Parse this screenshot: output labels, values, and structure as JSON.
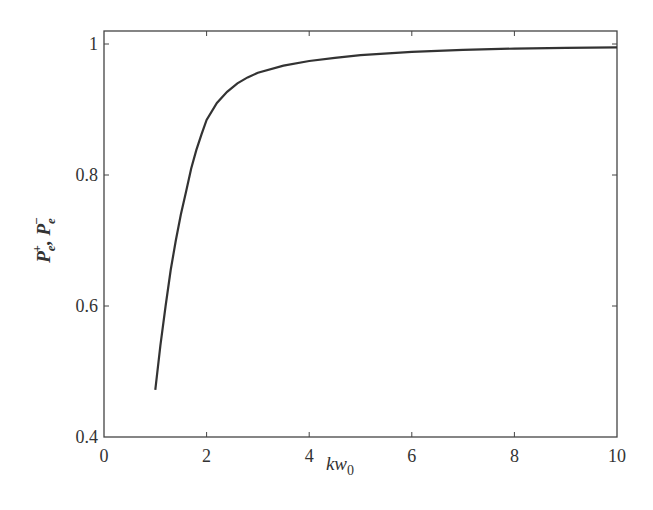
{
  "chart_data": {
    "type": "line",
    "title": "",
    "xlabel": "kw0",
    "xlabel_main": "kw",
    "xlabel_sub": "0",
    "ylabel": "P_e^+, P_e^-",
    "xlim": [
      0,
      10
    ],
    "ylim": [
      0.4,
      1.0
    ],
    "grid": false,
    "legend": null,
    "x_ticks": [
      0,
      2,
      4,
      6,
      8,
      10
    ],
    "x_tick_labels": [
      "0",
      "2",
      "4",
      "6",
      "8",
      "10"
    ],
    "y_ticks": [
      0.4,
      0.6,
      0.8,
      1.0
    ],
    "y_tick_labels": [
      "0.4",
      "0.6",
      "0.8",
      "1"
    ],
    "series": [
      {
        "name": "P_e^+, P_e^-",
        "color": "#333333",
        "x": [
          1.0,
          1.1,
          1.2,
          1.3,
          1.4,
          1.5,
          1.6,
          1.7,
          1.8,
          1.9,
          2.0,
          2.2,
          2.4,
          2.6,
          2.8,
          3.0,
          3.5,
          4.0,
          4.5,
          5.0,
          6.0,
          7.0,
          8.0,
          9.0,
          10.0
        ],
        "y": [
          0.472,
          0.54,
          0.6,
          0.655,
          0.7,
          0.74,
          0.775,
          0.81,
          0.838,
          0.862,
          0.884,
          0.91,
          0.927,
          0.94,
          0.949,
          0.956,
          0.967,
          0.974,
          0.979,
          0.983,
          0.988,
          0.991,
          0.993,
          0.994,
          0.995
        ]
      }
    ]
  }
}
